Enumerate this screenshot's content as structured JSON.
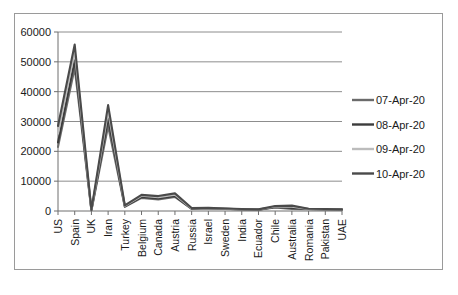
{
  "chart_data": {
    "type": "line",
    "title": "",
    "subtitle": "",
    "xlabel": "",
    "ylabel": "",
    "ylim": [
      0,
      60000
    ],
    "ytick_labels": [
      "0",
      "10000",
      "20000",
      "30000",
      "40000",
      "50000",
      "60000"
    ],
    "ytick_values": [
      0,
      10000,
      20000,
      30000,
      40000,
      50000,
      60000
    ],
    "grid": true,
    "legend_position": "right",
    "categories": [
      "US",
      "Spain",
      "UK",
      "Iran",
      "Turkey",
      "Belgium",
      "Canada",
      "Austria",
      "Russia",
      "Israel",
      "Sweden",
      "India",
      "Ecuador",
      "Chile",
      "Australia",
      "Romania",
      "Pakistan",
      "UAE"
    ],
    "series": [
      {
        "name": "07-Apr-20",
        "color": "#6b6b6b",
        "values": [
          21500,
          48000,
          200,
          28500,
          1400,
          4400,
          3900,
          4700,
          700,
          900,
          700,
          500,
          400,
          1200,
          700,
          600,
          500,
          400
        ]
      },
      {
        "name": "08-Apr-20",
        "color": "#3c3c3c",
        "values": [
          23000,
          50500,
          250,
          31000,
          1600,
          4700,
          4200,
          5000,
          800,
          950,
          750,
          550,
          450,
          1350,
          1000,
          650,
          550,
          450
        ]
      },
      {
        "name": "09-Apr-20",
        "color": "#bcbcbc",
        "values": [
          26000,
          53500,
          300,
          33500,
          1750,
          5100,
          4600,
          5500,
          900,
          1000,
          800,
          600,
          500,
          1500,
          1400,
          700,
          600,
          500
        ]
      },
      {
        "name": "10-Apr-20",
        "color": "#4a4a4a",
        "values": [
          28500,
          55800,
          350,
          35500,
          1900,
          5400,
          5000,
          5900,
          1000,
          1050,
          850,
          650,
          550,
          1650,
          1800,
          750,
          650,
          550
        ]
      }
    ]
  },
  "legend": {
    "entries": [
      {
        "label": "07-Apr-20"
      },
      {
        "label": "08-Apr-20"
      },
      {
        "label": "09-Apr-20"
      },
      {
        "label": "10-Apr-20"
      }
    ]
  }
}
